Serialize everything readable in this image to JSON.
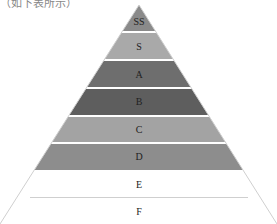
{
  "caption": "（如下表所示）",
  "pyramid": {
    "tiers": [
      {
        "label": "SS",
        "color": "#8a8a8a"
      },
      {
        "label": "S",
        "color": "#a9a9a9"
      },
      {
        "label": "A",
        "color": "#6e6e6e"
      },
      {
        "label": "B",
        "color": "#5e5e5e"
      },
      {
        "label": "C",
        "color": "#a3a3a3"
      },
      {
        "label": "D",
        "color": "#8d8d8d"
      },
      {
        "label": "E",
        "color": "#ffffff"
      },
      {
        "label": "F",
        "color": "#ffffff"
      }
    ]
  }
}
